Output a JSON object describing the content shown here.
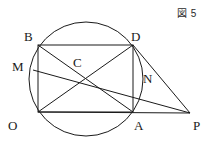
{
  "figure": {
    "caption": "図 5",
    "stroke_color": "#1a1a1a",
    "label_color": "#1a1a1a",
    "background_color": "#ffffff",
    "points": [
      {
        "name": "B",
        "label": "B",
        "label_x": 24,
        "label_y": 30,
        "x": 38,
        "y": 45
      },
      {
        "name": "D",
        "label": "D",
        "label_x": 131,
        "label_y": 30,
        "x": 133,
        "y": 45
      },
      {
        "name": "M",
        "label": "M",
        "label_x": 12,
        "label_y": 60,
        "x": 33,
        "y": 70
      },
      {
        "name": "C",
        "label": "C",
        "label_x": 73,
        "label_y": 56,
        "x": 82,
        "y": 78
      },
      {
        "name": "N",
        "label": "N",
        "label_x": 143,
        "label_y": 72,
        "x": 133,
        "y": 90
      },
      {
        "name": "O",
        "label": "O",
        "label_x": 8,
        "label_y": 119,
        "x": 38,
        "y": 112
      },
      {
        "name": "A",
        "label": "A",
        "label_x": 134,
        "label_y": 119,
        "x": 133,
        "y": 112
      },
      {
        "name": "P",
        "label": "P",
        "label_x": 193,
        "label_y": 119,
        "x": 190,
        "y": 113
      }
    ],
    "circle": {
      "cx": 86,
      "cy": 79,
      "r": 57
    },
    "rectangle": {
      "x": 38,
      "y": 45,
      "width": 95,
      "height": 67
    },
    "segments": [
      {
        "name": "diagonal-B-A",
        "x1": 38,
        "y1": 45,
        "x2": 133,
        "y2": 112
      },
      {
        "name": "diagonal-O-D",
        "x1": 38,
        "y1": 112,
        "x2": 133,
        "y2": 45
      },
      {
        "name": "line-M-P",
        "x1": 33,
        "y1": 70,
        "x2": 190,
        "y2": 113
      },
      {
        "name": "line-O-P",
        "x1": 38,
        "y1": 112,
        "x2": 190,
        "y2": 113
      },
      {
        "name": "line-D-P",
        "x1": 133,
        "y1": 45,
        "x2": 190,
        "y2": 113
      }
    ]
  }
}
